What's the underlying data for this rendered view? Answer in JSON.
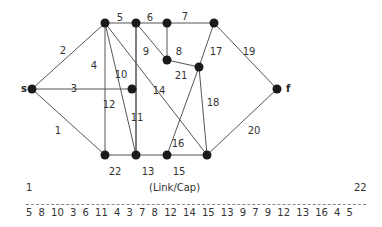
{
  "diagram": {
    "nodes": [
      {
        "id": "s",
        "x": 32,
        "y": 89,
        "label": "s"
      },
      {
        "id": "A",
        "x": 105,
        "y": 23,
        "label": ""
      },
      {
        "id": "B",
        "x": 136,
        "y": 23,
        "label": ""
      },
      {
        "id": "C",
        "x": 167,
        "y": 23,
        "label": ""
      },
      {
        "id": "D",
        "x": 214,
        "y": 23,
        "label": ""
      },
      {
        "id": "E",
        "x": 132,
        "y": 89,
        "label": ""
      },
      {
        "id": "F",
        "x": 167,
        "y": 60,
        "label": ""
      },
      {
        "id": "G",
        "x": 199,
        "y": 67,
        "label": ""
      },
      {
        "id": "f",
        "x": 277,
        "y": 89,
        "label": "f"
      },
      {
        "id": "H",
        "x": 105,
        "y": 155,
        "label": ""
      },
      {
        "id": "I",
        "x": 136,
        "y": 155,
        "label": ""
      },
      {
        "id": "J",
        "x": 167,
        "y": 155,
        "label": ""
      },
      {
        "id": "K",
        "x": 207,
        "y": 155,
        "label": ""
      }
    ],
    "edges": [
      {
        "label": "1",
        "from": "s",
        "to": "H",
        "lx": 58,
        "ly": 131
      },
      {
        "label": "2",
        "from": "s",
        "to": "A",
        "lx": 63,
        "ly": 51
      },
      {
        "label": "3",
        "from": "s",
        "to": "E",
        "lx": 74,
        "ly": 89
      },
      {
        "label": "4",
        "from": "A",
        "to": "H",
        "lx": 94,
        "ly": 66
      },
      {
        "label": "5",
        "from": "A",
        "to": "B",
        "lx": 120,
        "ly": 18
      },
      {
        "label": "6",
        "from": "B",
        "to": "C",
        "lx": 150,
        "ly": 18
      },
      {
        "label": "7",
        "from": "C",
        "to": "D",
        "lx": 185,
        "ly": 17
      },
      {
        "label": "8",
        "from": "C",
        "to": "F",
        "lx": 179,
        "ly": 52
      },
      {
        "label": "9",
        "from": "B",
        "to": "F",
        "lx": 146,
        "ly": 52
      },
      {
        "label": "10",
        "from": "B",
        "to": "I",
        "lx": 121,
        "ly": 75
      },
      {
        "label": "11",
        "from": "B",
        "to": "I",
        "lx": 137,
        "ly": 118
      },
      {
        "label": "12",
        "from": "A",
        "to": "I",
        "lx": 109,
        "ly": 105
      },
      {
        "label": "13",
        "from": "I",
        "to": "J",
        "lx": 148,
        "ly": 172
      },
      {
        "label": "14",
        "from": "A",
        "to": "K",
        "lx": 159,
        "ly": 91
      },
      {
        "label": "15",
        "from": "J",
        "to": "K",
        "lx": 179,
        "ly": 172
      },
      {
        "label": "16",
        "from": "G",
        "to": "J",
        "lx": 178,
        "ly": 144
      },
      {
        "label": "17",
        "from": "D",
        "to": "G",
        "lx": 216,
        "ly": 52
      },
      {
        "label": "18",
        "from": "G",
        "to": "K",
        "lx": 213,
        "ly": 103
      },
      {
        "label": "19",
        "from": "D",
        "to": "f",
        "lx": 249,
        "ly": 52
      },
      {
        "label": "20",
        "from": "f",
        "to": "K",
        "lx": 254,
        "ly": 131
      },
      {
        "label": "21",
        "from": "F",
        "to": "G",
        "lx": 181,
        "ly": 76
      },
      {
        "label": "22",
        "from": "H",
        "to": "I",
        "lx": 115,
        "ly": 172
      }
    ]
  },
  "caption": {
    "start_index": "1",
    "title": "(Link/Cap)",
    "end_index": "22",
    "capacities": "5  8  10  3  6  11  4  3  7  8  12  14  15  13  9  7  9  12  13  16  4  5"
  }
}
